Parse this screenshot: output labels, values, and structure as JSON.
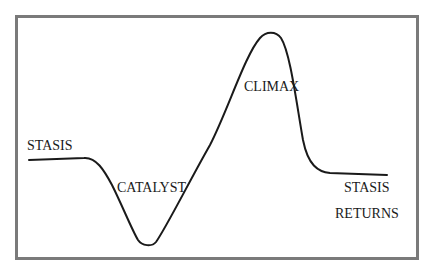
{
  "diagram": {
    "type": "story-arc",
    "labels": {
      "stasis": "STASIS",
      "catalyst": "CATALYST",
      "climax": "CLIMAX",
      "stasis_returns_line1": "STASIS",
      "stasis_returns_line2": "RETURNS"
    },
    "colors": {
      "frame": "#7a7a7a",
      "curve": "#1a1a1a",
      "background": "#ffffff"
    }
  }
}
